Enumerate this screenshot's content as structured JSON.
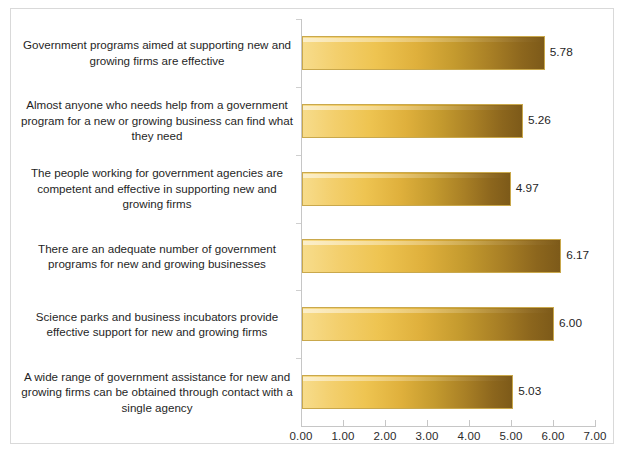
{
  "chart_data": {
    "type": "bar",
    "orientation": "horizontal",
    "title": "",
    "xlabel": "",
    "ylabel": "",
    "xlim": [
      0,
      7
    ],
    "xtick_labels": [
      "0.00",
      "1.00",
      "2.00",
      "3.00",
      "4.00",
      "5.00",
      "6.00",
      "7.00"
    ],
    "xticks": [
      0,
      1,
      2,
      3,
      4,
      5,
      6,
      7
    ],
    "grid": false,
    "legend": null,
    "categories": [
      "Government programs aimed at supporting new and growing firms are effective",
      "Almost anyone who needs help from a government program for a new or growing business can find what they need",
      "The people working for government agencies are competent and effective in supporting new and growing firms",
      "There are an adequate number of government programs for new and growing businesses",
      "Science parks and business incubators provide effective support for new and growing firms",
      "A wide range of government assistance for new and growing firms can be obtained through contact with a single agency"
    ],
    "values": [
      5.78,
      5.26,
      4.97,
      6.17,
      6.0,
      5.03
    ],
    "value_labels": [
      "5.78",
      "5.26",
      "4.97",
      "6.17",
      "6.00",
      "5.03"
    ],
    "bar_gradient_start": "#F7DC8B",
    "bar_gradient_mid": "#DFB03C",
    "bar_gradient_end": "#7D5A19",
    "bar_border_color": "#C9A84C",
    "axis_color": "#C6C6C6",
    "text_color": "#1F1F1F",
    "frame_border_color": "#D9D9D9",
    "background_color": "#FFFFFF"
  }
}
